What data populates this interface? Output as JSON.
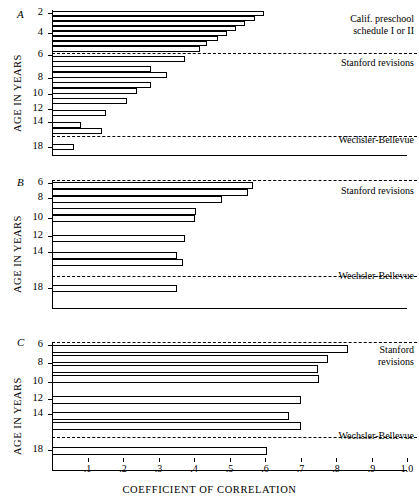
{
  "figure": {
    "xlabel": "COEFFICIENT OF CORRELATION",
    "ylabel": "AGE IN YEARS",
    "x_ticks": [
      ".1",
      ".2",
      ".3",
      ".4",
      ".5",
      ".6",
      ".7",
      ".8",
      ".9",
      "1.0"
    ],
    "x_tick_values": [
      0.1,
      0.2,
      0.3,
      0.4,
      0.5,
      0.6,
      0.7,
      0.8,
      0.9,
      1.0
    ]
  },
  "panels": [
    {
      "letter": "A",
      "ylabel": "AGE IN YEARS",
      "y_ticks": [
        "2",
        "4",
        "6",
        "8",
        "10",
        "12",
        "14",
        "18"
      ],
      "legends": [
        {
          "text": "Calif. preschool\nschedule I or II"
        },
        {
          "text": "Stanford revisions"
        },
        {
          "text": "Wechsler-Bellevue"
        }
      ]
    },
    {
      "letter": "B",
      "ylabel": "AGE IN YEARS",
      "y_ticks": [
        "6",
        "8",
        "10",
        "12",
        "14",
        "18"
      ],
      "legends": [
        {
          "text": "Stanford revisions"
        },
        {
          "text": "Wechsler-Bellevue"
        }
      ]
    },
    {
      "letter": "C",
      "ylabel": "AGE IN YEARS",
      "y_ticks": [
        "6",
        "8",
        "10",
        "12",
        "14",
        "18"
      ],
      "legends": [
        {
          "text": "Stanford\nrevisions"
        },
        {
          "text": "Wechsler-Bellevue"
        }
      ]
    }
  ],
  "chart_data": [
    {
      "type": "bar",
      "orientation": "horizontal",
      "panel": "A",
      "title": "A",
      "xlabel": "COEFFICIENT OF CORRELATION",
      "ylabel": "AGE IN YEARS",
      "xlim": [
        0.0,
        1.0
      ],
      "grid": false,
      "categories": [
        "2",
        "2.5",
        "3",
        "3.5",
        "4",
        "4.5",
        "5",
        "6",
        "7",
        "8",
        "9",
        "10",
        "12",
        "14",
        "15",
        "18"
      ],
      "values": [
        0.6,
        0.55,
        0.52,
        0.48,
        0.42,
        0.4,
        0.37,
        0.28,
        0.32,
        0.28,
        0.24,
        0.21,
        0.15,
        0.08,
        0.14,
        0.06
      ],
      "group_labels": [
        "Calif. preschool schedule I or II",
        "Stanford revisions",
        "Wechsler-Bellevue"
      ]
    },
    {
      "type": "bar",
      "orientation": "horizontal",
      "panel": "B",
      "title": "B",
      "xlabel": "COEFFICIENT OF CORRELATION",
      "ylabel": "AGE IN YEARS",
      "xlim": [
        0.0,
        1.0
      ],
      "grid": false,
      "categories": [
        "6",
        "7",
        "8",
        "9",
        "10",
        "12",
        "14",
        "15",
        "18"
      ],
      "values": [
        0.565,
        0.555,
        0.48,
        0.405,
        0.405,
        0.375,
        0.355,
        0.375,
        0.355
      ],
      "group_labels": [
        "Stanford revisions",
        "Wechsler-Bellevue"
      ]
    },
    {
      "type": "bar",
      "orientation": "horizontal",
      "panel": "C",
      "title": "C",
      "xlabel": "COEFFICIENT OF CORRELATION",
      "ylabel": "AGE IN YEARS",
      "xlim": [
        0.0,
        1.0
      ],
      "grid": false,
      "categories": [
        "6",
        "8",
        "9",
        "10",
        "12",
        "14",
        "15",
        "18"
      ],
      "values": [
        0.835,
        0.775,
        0.745,
        0.75,
        0.7,
        0.67,
        0.7,
        0.605
      ],
      "group_labels": [
        "Stanford revisions",
        "Wechsler-Bellevue"
      ]
    }
  ],
  "panel_geometry": {
    "axis_x0": 52,
    "axis_x1": 407,
    "panelA": {
      "top": 10,
      "bottom": 152,
      "bars": [
        {
          "y": 11,
          "h": 5,
          "v": 0.598
        },
        {
          "y": 16,
          "h": 5,
          "v": 0.572
        },
        {
          "y": 21,
          "h": 5,
          "v": 0.545
        },
        {
          "y": 26,
          "h": 5,
          "v": 0.518
        },
        {
          "y": 31,
          "h": 5,
          "v": 0.482
        },
        {
          "y": 36,
          "h": 5,
          "v": 0.462
        },
        {
          "y": 41,
          "h": 5,
          "v": 0.418
        },
        {
          "y": 46,
          "h": 6,
          "v": 0.402
        },
        {
          "y": 56,
          "h": 6,
          "v": 0.372
        },
        {
          "y": 62,
          "h": 6,
          "v": 0.278
        },
        {
          "y": 72,
          "h": 6,
          "v": 0.322
        },
        {
          "y": 78,
          "h": 6,
          "v": 0.278
        },
        {
          "y": 88,
          "h": 6,
          "v": 0.238
        },
        {
          "y": 94,
          "h": 6,
          "v": 0.212
        },
        {
          "y": 104,
          "h": 6,
          "v": 0.152
        },
        {
          "y": 117,
          "h": 6,
          "v": 0.082
        },
        {
          "y": 123,
          "h": 6,
          "v": 0.142
        },
        {
          "y": 140,
          "h": 6,
          "v": 0.062
        }
      ],
      "dashes": [
        {
          "y": 52
        },
        {
          "y": 133
        }
      ],
      "yticks": [
        {
          "label": "2",
          "y": 12
        },
        {
          "label": "4",
          "y": 29
        },
        {
          "label": "6",
          "y": 52
        },
        {
          "label": "8",
          "y": 74
        },
        {
          "label": "10",
          "y": 91
        },
        {
          "label": "12",
          "y": 106
        },
        {
          "label": "14",
          "y": 118
        },
        {
          "label": "18",
          "y": 142
        }
      ]
    }
  }
}
